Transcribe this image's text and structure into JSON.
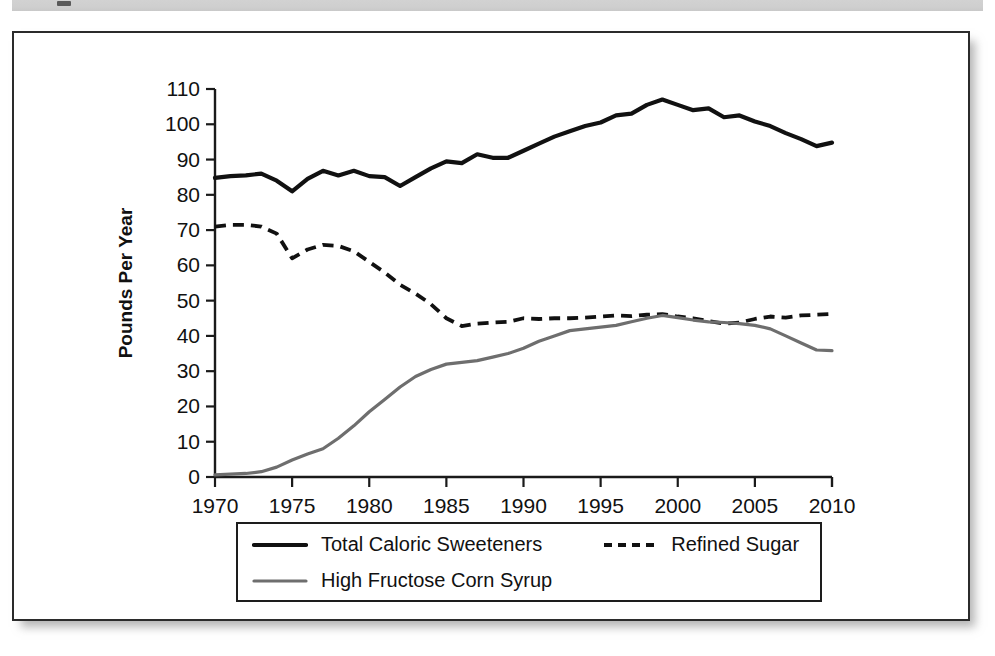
{
  "figure": {
    "y_axis_title": "Pounds Per Year"
  },
  "legend": {
    "entries": [
      {
        "label": "Total Caloric Sweeteners",
        "style": "solid-black",
        "swatch_icon": "solid-line-icon"
      },
      {
        "label": "Refined Sugar",
        "style": "dashed-black",
        "swatch_icon": "dashed-line-icon"
      },
      {
        "label": "High Fructose Corn Syrup",
        "style": "solid-gray",
        "swatch_icon": "gray-line-icon"
      }
    ]
  },
  "colors": {
    "total": "#111111",
    "refined": "#111111",
    "hfcs": "#6e6e6e",
    "axis": "#1a1a1a",
    "frame": "#2b2b2b",
    "background": "#ffffff",
    "header_band": "#d2d2d2"
  },
  "chart_data": {
    "type": "line",
    "title": "",
    "xlabel": "",
    "ylabel": "Pounds Per Year",
    "xlim": [
      1970,
      2010
    ],
    "ylim": [
      0,
      110
    ],
    "ytick_labels": [
      "0",
      "10",
      "20",
      "30",
      "40",
      "50",
      "60",
      "70",
      "80",
      "90",
      "100",
      "110"
    ],
    "yticks": [
      0,
      10,
      20,
      30,
      40,
      50,
      60,
      70,
      80,
      90,
      100,
      110
    ],
    "xtick_labels": [
      "1970",
      "1975",
      "1980",
      "1985",
      "1990",
      "1995",
      "2000",
      "2005",
      "2010"
    ],
    "xticks": [
      1970,
      1975,
      1980,
      1985,
      1990,
      1995,
      2000,
      2005,
      2010
    ],
    "grid": false,
    "legend_position": "below-axes",
    "x": [
      1970,
      1971,
      1972,
      1973,
      1974,
      1975,
      1976,
      1977,
      1978,
      1979,
      1980,
      1981,
      1982,
      1983,
      1984,
      1985,
      1986,
      1987,
      1988,
      1989,
      1990,
      1991,
      1992,
      1993,
      1994,
      1995,
      1996,
      1997,
      1998,
      1999,
      2000,
      2001,
      2002,
      2003,
      2004,
      2005,
      2006,
      2007,
      2008,
      2009,
      2010
    ],
    "series": [
      {
        "name": "Total Caloric Sweeteners",
        "values": [
          84.8,
          85.3,
          85.5,
          86.0,
          84.0,
          81.0,
          84.5,
          86.8,
          85.5,
          86.8,
          85.3,
          85.0,
          82.5,
          85.0,
          87.5,
          89.5,
          89.0,
          91.5,
          90.5,
          90.5,
          92.5,
          94.5,
          96.5,
          98.0,
          99.5,
          100.5,
          102.5,
          103.0,
          105.5,
          107.0,
          105.5,
          104.0,
          104.5,
          102.0,
          102.5,
          100.8,
          99.5,
          97.5,
          95.8,
          93.8,
          94.8
        ]
      },
      {
        "name": "Refined Sugar",
        "values": [
          71.0,
          71.5,
          71.5,
          71.0,
          69.0,
          62.0,
          64.5,
          65.8,
          65.5,
          64.0,
          61.0,
          58.0,
          54.5,
          52.0,
          49.0,
          45.0,
          42.8,
          43.5,
          43.8,
          44.0,
          45.0,
          44.8,
          45.0,
          45.0,
          45.2,
          45.5,
          45.8,
          45.6,
          46.0,
          46.2,
          45.5,
          45.0,
          44.2,
          43.5,
          43.8,
          44.8,
          45.5,
          45.2,
          45.8,
          46.0,
          46.2
        ]
      },
      {
        "name": "High Fructose Corn Syrup",
        "values": [
          0.6,
          0.8,
          1.0,
          1.5,
          2.8,
          4.8,
          6.5,
          8.0,
          11.0,
          14.5,
          18.5,
          22.0,
          25.5,
          28.5,
          30.5,
          32.0,
          32.5,
          33.0,
          34.0,
          35.0,
          36.5,
          38.5,
          40.0,
          41.5,
          42.0,
          42.5,
          43.0,
          44.0,
          45.0,
          45.8,
          45.2,
          44.5,
          44.0,
          43.8,
          43.5,
          43.0,
          42.0,
          40.0,
          38.0,
          36.0,
          35.8
        ]
      }
    ]
  }
}
